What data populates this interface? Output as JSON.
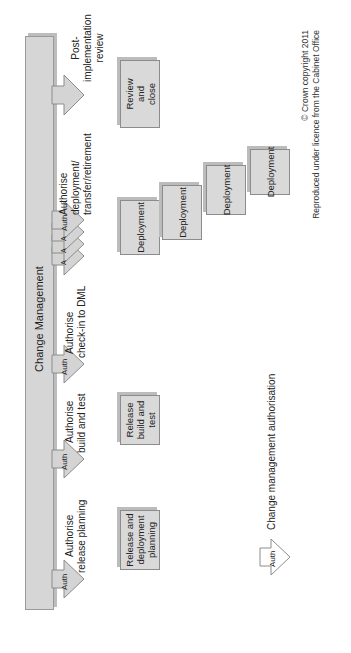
{
  "diagram": {
    "bar_label": "Change Management",
    "auth_points": [
      {
        "arrow_label": "Auth",
        "label_line1": "Authorise",
        "label_line2": "release planning"
      },
      {
        "arrow_label": "Auth",
        "label_line1": "Authorise",
        "label_line2": "build and test"
      },
      {
        "arrow_label": "Auth",
        "label_line1": "Authorise",
        "label_line2": "check-in to DML"
      },
      {
        "arrow_label": "Auth",
        "stacked_labels": [
          "A",
          "A",
          "A"
        ],
        "label_line1": "Authorise",
        "label_line2": "deployment/",
        "label_line3": "transfer/retirement"
      },
      {
        "label_line1": "Post-",
        "label_line2": "implementation",
        "label_line3": "review"
      }
    ],
    "boxes": {
      "release_planning": {
        "line1": "Release and",
        "line2": "deployment",
        "line3": "planning"
      },
      "build_test": {
        "line1": "Release",
        "line2": "build and",
        "line3": "test"
      },
      "deployments": [
        "Deployment",
        "Deployment",
        "Deployment",
        "Deployment"
      ],
      "review_close": {
        "line1": "Review",
        "line2": "and",
        "line3": "close"
      }
    },
    "legend": {
      "arrow_label": "Auth",
      "text": "Change management authorisation"
    },
    "copyright": {
      "line1": "© Crown copyright 2011",
      "line2": "Reproduced under licence from the Cabinet Office"
    },
    "colors": {
      "bar_fill": "#d6d6d6",
      "box_fill": "#d9d9d9",
      "border": "#8c8c8c",
      "arrow_fill": "#d4d4d4"
    }
  }
}
